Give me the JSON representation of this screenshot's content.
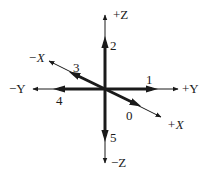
{
  "diagram": {
    "title": "",
    "origin": {
      "x": 105,
      "y": 89
    },
    "colors": {
      "line": "#1a1a1a",
      "background": "#ffffff"
    },
    "axes": [
      {
        "id": "pos-z",
        "label": "+Z",
        "tip": [
          105,
          15
        ],
        "thick_end": [
          105,
          42
        ],
        "number": "2",
        "number_pos": [
          110,
          50
        ],
        "label_pos": [
          113,
          19
        ]
      },
      {
        "id": "neg-z",
        "label": "−Z",
        "tip": [
          105,
          163
        ],
        "thick_end": [
          105,
          136
        ],
        "number": "5",
        "number_pos": [
          110,
          142
        ],
        "label_pos": [
          111,
          167
        ]
      },
      {
        "id": "pos-y",
        "label": "+Y",
        "tip": [
          178,
          89
        ],
        "thick_end": [
          152,
          89
        ],
        "number": "1",
        "number_pos": [
          146,
          84
        ],
        "label_pos": [
          182,
          93
        ]
      },
      {
        "id": "neg-y",
        "label": "−Y",
        "tip": [
          33,
          89
        ],
        "thick_end": [
          59,
          89
        ],
        "number": "4",
        "number_pos": [
          56,
          105
        ],
        "label_pos": [
          9,
          93
        ]
      },
      {
        "id": "neg-x",
        "label": "−X",
        "tip": [
          49,
          61
        ],
        "thick_end": [
          74,
          74
        ],
        "number": "3",
        "number_pos": [
          73,
          72
        ],
        "label_pos": [
          28,
          62
        ]
      },
      {
        "id": "pos-x",
        "label": "+X",
        "tip": [
          161,
          117
        ],
        "thick_end": [
          136,
          104
        ],
        "number": "0",
        "number_pos": [
          126,
          120
        ],
        "label_pos": [
          167,
          129
        ]
      }
    ]
  }
}
